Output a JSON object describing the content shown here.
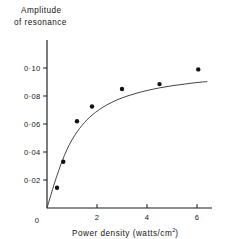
{
  "chart_data": {
    "type": "scatter",
    "title": "Amplitude of resonance",
    "title_lines": [
      "Amplitude",
      "of resonance"
    ],
    "xlabel": "Power density  (watts/cm²)",
    "xlabel_text": "Power density  (watts/cm",
    "xlabel_sup": "2",
    "xlabel_tail": ")",
    "ylabel": "Amplitude of resonance",
    "xlim": [
      0,
      6.6
    ],
    "ylim": [
      0,
      0.108
    ],
    "grid": false,
    "legend": null,
    "x_ticks": [
      0,
      2,
      4,
      6
    ],
    "x_tick_labels": [
      "0",
      "2",
      "4",
      "6"
    ],
    "y_ticks": [
      0,
      0.02,
      0.04,
      0.06,
      0.08,
      0.1
    ],
    "y_tick_labels": [
      "0",
      "0·02",
      "0·04",
      "0·06",
      "0·08",
      "0·10"
    ],
    "x": [
      0.4,
      0.65,
      1.2,
      1.8,
      3.0,
      4.5,
      6.05
    ],
    "y": [
      0.0145,
      0.033,
      0.062,
      0.0725,
      0.085,
      0.0885,
      0.099
    ],
    "points": [
      {
        "x": 0.4,
        "y": 0.0145
      },
      {
        "x": 0.65,
        "y": 0.033
      },
      {
        "x": 1.2,
        "y": 0.062
      },
      {
        "x": 1.8,
        "y": 0.0725
      },
      {
        "x": 3.0,
        "y": 0.085
      },
      {
        "x": 4.5,
        "y": 0.0885
      },
      {
        "x": 6.05,
        "y": 0.099
      }
    ],
    "fit_curve": {
      "description": "smooth saturating curve through the data",
      "x": [
        0.0,
        0.15,
        0.3,
        0.45,
        0.6,
        0.8,
        1.0,
        1.2,
        1.4,
        1.6,
        1.8,
        2.1,
        2.4,
        2.8,
        3.2,
        3.6,
        4.0,
        4.5,
        5.0,
        5.5,
        6.0,
        6.4
      ],
      "y": [
        0.0,
        0.009,
        0.0178,
        0.0258,
        0.0332,
        0.0418,
        0.0487,
        0.0543,
        0.059,
        0.063,
        0.0663,
        0.0704,
        0.0737,
        0.0772,
        0.0799,
        0.0821,
        0.0839,
        0.0858,
        0.0873,
        0.0885,
        0.0896,
        0.0903
      ]
    },
    "marker_color": "#111111",
    "line_color": "#3a3a3a",
    "axis_color": "#1a1a1a",
    "marker_size": 4.4
  },
  "figure": {
    "title_lines": [
      "Amplitude",
      "of resonance"
    ],
    "x_caption_main": "Power density   (watts/cm",
    "x_caption_sup": "2",
    "x_caption_close": ")"
  }
}
